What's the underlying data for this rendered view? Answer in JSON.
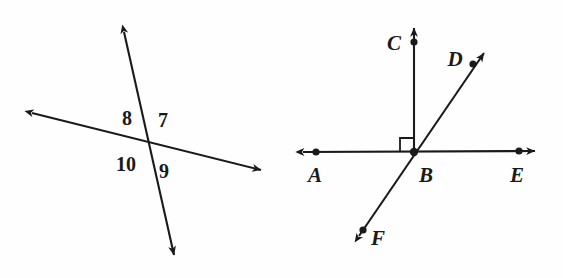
{
  "figure": {
    "background_color": "#fefefe",
    "ink_color": "#1a1a1a"
  },
  "left_diagram": {
    "name": "intersecting-lines-numbered-angles",
    "intersection": {
      "x": 147,
      "y": 143
    },
    "lines": [
      {
        "id": "steep-line",
        "from": {
          "x": 122,
          "y": 25
        },
        "to": {
          "x": 176,
          "y": 263
        },
        "arrowheads": "both"
      },
      {
        "id": "shallow-line",
        "from": {
          "x": 28,
          "y": 112
        },
        "to": {
          "x": 266,
          "y": 172
        },
        "arrowheads": "both"
      }
    ],
    "angle_labels": [
      {
        "id": "angle-8",
        "text": "8",
        "x": 127,
        "y": 125,
        "position": "upper-left"
      },
      {
        "id": "angle-7",
        "text": "7",
        "x": 163,
        "y": 127,
        "position": "upper-right"
      },
      {
        "id": "angle-10",
        "text": "10",
        "x": 126,
        "y": 164,
        "position": "lower-left"
      },
      {
        "id": "angle-9",
        "text": "9",
        "x": 164,
        "y": 171,
        "position": "lower-right"
      }
    ]
  },
  "right_diagram": {
    "name": "rays-from-vertex-b",
    "vertex": {
      "id": "B",
      "x": 414,
      "y": 152
    },
    "lines": [
      {
        "id": "line-AE",
        "from": {
          "x": 298,
          "y": 152
        },
        "to": {
          "x": 540,
          "y": 151
        },
        "arrowheads": "both"
      },
      {
        "id": "ray-BC",
        "from": {
          "x": 414,
          "y": 152
        },
        "to": {
          "x": 414,
          "y": 22
        },
        "arrowheads": "end"
      },
      {
        "id": "line-FD",
        "from": {
          "x": 354,
          "y": 243
        },
        "to": {
          "x": 489,
          "y": 46
        },
        "arrowheads": "both"
      }
    ],
    "right_angle_marker": {
      "id": "right-angle-ABC",
      "corner": {
        "x": 414,
        "y": 152
      },
      "size": 14
    },
    "points": [
      {
        "id": "A",
        "label": "A",
        "dot_x": 316,
        "dot_y": 152,
        "label_x": 315,
        "label_y": 180
      },
      {
        "id": "B",
        "label": "B",
        "dot_x": 414,
        "dot_y": 152,
        "label_x": 425,
        "label_y": 180
      },
      {
        "id": "C",
        "label": "C",
        "dot_x": 414,
        "dot_y": 42,
        "label_x": 394,
        "label_y": 49
      },
      {
        "id": "D",
        "label": "D",
        "dot_x": 473,
        "dot_y": 64,
        "label_x": 455,
        "label_y": 65
      },
      {
        "id": "E",
        "label": "E",
        "dot_x": 519,
        "dot_y": 151,
        "label_x": 516,
        "label_y": 180
      },
      {
        "id": "F",
        "label": "F",
        "dot_x": 363,
        "dot_y": 230,
        "label_x": 375,
        "label_y": 242
      }
    ]
  }
}
